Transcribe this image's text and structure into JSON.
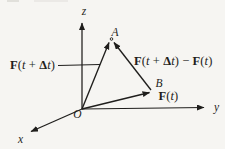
{
  "canvas": {
    "background": "#f6f5f2",
    "ink": "#1f1e1c"
  },
  "axes": {
    "z": "z",
    "y": "y",
    "x": "x",
    "origin": "O"
  },
  "points": {
    "a": "A",
    "b": "B"
  },
  "vector_labels": {
    "oa": {
      "text": "F(t + Δt)",
      "segments": [
        {
          "t": "F",
          "s": "bf"
        },
        {
          "t": "(",
          "s": "rm"
        },
        {
          "t": "t",
          "s": "it"
        },
        {
          "t": " + ",
          "s": "rm"
        },
        {
          "t": "Δ",
          "s": "bf"
        },
        {
          "t": "t",
          "s": "it"
        },
        {
          "t": ")",
          "s": "rm"
        }
      ]
    },
    "difference": {
      "text": "F(t + Δt) − F(t)",
      "segments": [
        {
          "t": "F",
          "s": "bf"
        },
        {
          "t": "(",
          "s": "rm"
        },
        {
          "t": "t",
          "s": "it"
        },
        {
          "t": " + ",
          "s": "rm"
        },
        {
          "t": "Δ",
          "s": "bf"
        },
        {
          "t": "t",
          "s": "it"
        },
        {
          "t": ") − ",
          "s": "rm"
        },
        {
          "t": "F",
          "s": "bf"
        },
        {
          "t": "(",
          "s": "rm"
        },
        {
          "t": "t",
          "s": "it"
        },
        {
          "t": ")",
          "s": "rm"
        }
      ]
    },
    "ob": {
      "text": "F(t)",
      "segments": [
        {
          "t": "F",
          "s": "bf"
        },
        {
          "t": "(",
          "s": "rm"
        },
        {
          "t": "t",
          "s": "it"
        },
        {
          "t": ")",
          "s": "rm"
        }
      ]
    }
  }
}
